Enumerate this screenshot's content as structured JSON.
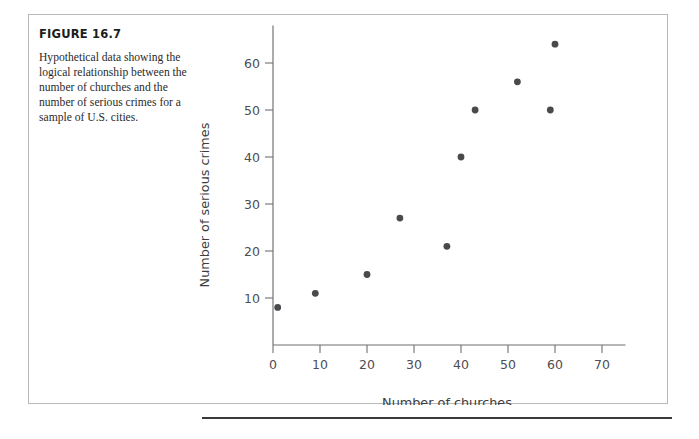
{
  "figure": {
    "title": "FIGURE 16.7",
    "caption": "Hypothetical data showing the logical relationship between the number of churches and the number of serious crimes for a sample of U.S. cities."
  },
  "colors": {
    "marker": "#4a4a4d",
    "axis": "#6f6f74",
    "frame": "#b9b9b9",
    "rule": "#3a3a3a"
  },
  "chart_data": {
    "type": "scatter",
    "title": "",
    "xlabel": "Number of churches",
    "ylabel": "Number of serious crimes",
    "xlim": [
      0,
      75
    ],
    "ylim": [
      0,
      68
    ],
    "xticks": [
      0,
      10,
      20,
      30,
      40,
      50,
      60,
      70
    ],
    "xtick_labels": [
      "0",
      "10",
      "20",
      "30",
      "40",
      "50",
      "60",
      "70"
    ],
    "yticks": [
      10,
      20,
      30,
      40,
      50,
      60
    ],
    "ytick_labels": [
      "10",
      "20",
      "30",
      "40",
      "50",
      "60"
    ],
    "grid": false,
    "legend": null,
    "series": [
      {
        "name": "U.S. cities",
        "points": [
          {
            "x": 1,
            "y": 8
          },
          {
            "x": 9,
            "y": 11
          },
          {
            "x": 20,
            "y": 15
          },
          {
            "x": 27,
            "y": 27
          },
          {
            "x": 37,
            "y": 21
          },
          {
            "x": 40,
            "y": 40
          },
          {
            "x": 43,
            "y": 50
          },
          {
            "x": 52,
            "y": 56
          },
          {
            "x": 59,
            "y": 50
          },
          {
            "x": 60,
            "y": 64
          }
        ]
      }
    ]
  }
}
